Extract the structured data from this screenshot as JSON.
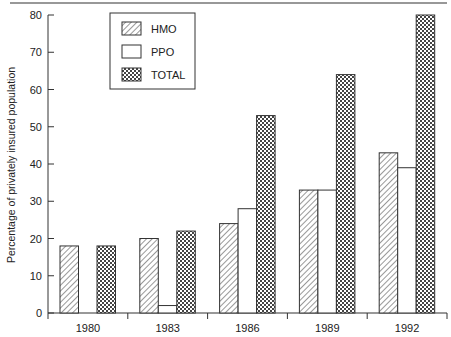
{
  "chart_data": {
    "type": "bar",
    "title": "",
    "xlabel": "",
    "ylabel": "Percentage of privately insured population",
    "categories": [
      "1980",
      "1983",
      "1986",
      "1989",
      "1992"
    ],
    "series": [
      {
        "name": "HMO",
        "pattern": "diagonal-hatch",
        "values": [
          18,
          20,
          24,
          33,
          43
        ]
      },
      {
        "name": "PPO",
        "pattern": "blank",
        "values": [
          0,
          2,
          28,
          33,
          39
        ]
      },
      {
        "name": "TOTAL",
        "pattern": "crosshatch",
        "values": [
          18,
          22,
          53,
          64,
          80
        ]
      }
    ],
    "ylim": [
      0,
      80
    ],
    "yticks": [
      0,
      10,
      20,
      30,
      40,
      50,
      60,
      70,
      80
    ],
    "grid": false,
    "legend_position": "upper-left-inside",
    "colors": {
      "stroke": "#222222",
      "fill": "#ffffff",
      "pattern": "#333333"
    }
  },
  "legend": {
    "items": [
      {
        "label": "HMO",
        "pattern": "diagonal-hatch"
      },
      {
        "label": "PPO",
        "pattern": "blank"
      },
      {
        "label": "TOTAL",
        "pattern": "crosshatch"
      }
    ]
  }
}
